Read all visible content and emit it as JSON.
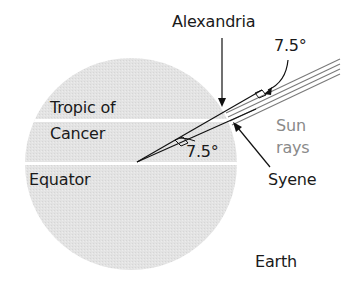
{
  "diagram": {
    "labels": {
      "alexandria": "Alexandria",
      "angle_top": "7.5°",
      "tropic_line1": "Tropic of",
      "tropic_line2": "Cancer",
      "angle_center": "7.5°",
      "sun_line1": "Sun",
      "sun_line2": "rays",
      "equator": "Equator",
      "syene": "Syene",
      "earth": "Earth"
    },
    "colors": {
      "earth_fill": "#e2e2e2",
      "latitude_lines": "#ffffff",
      "rays": "#7a7a7a",
      "lines": "#111111",
      "sun_label": "#8a8a8a"
    }
  }
}
